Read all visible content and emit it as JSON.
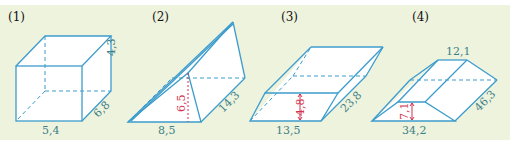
{
  "figures": [
    {
      "label": "(1)",
      "shape": "rectangular prism",
      "dimensions": {
        "length": "5,4",
        "depth": "6,8",
        "height": "4,3"
      }
    },
    {
      "label": "(2)",
      "shape": "triangular prism",
      "dimensions": {
        "base": "8,5",
        "triangle_height": "6,5",
        "length": "14,3"
      }
    },
    {
      "label": "(3)",
      "shape": "parallelepiped",
      "dimensions": {
        "base": "13,5",
        "height": "4,8",
        "length": "23,8"
      }
    },
    {
      "label": "(4)",
      "shape": "trapezoidal prism",
      "dimensions": {
        "bottom_base": "34,2",
        "top_base": "12,1",
        "height": "7,1",
        "length": "46,3"
      }
    }
  ],
  "colors": {
    "panel_background": "#eef3de",
    "edge": "#3c9ccc",
    "dimension_text": "#3d7f86",
    "height_marker": "#d2324c"
  }
}
